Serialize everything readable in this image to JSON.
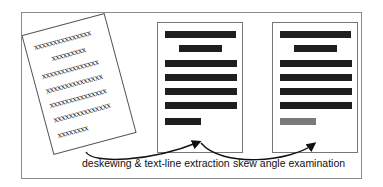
{
  "diagram": {
    "skewed_page": {
      "lines": [
        "xxxxxxxxxxxxxxx",
        "xxxxxxxxx",
        "xxxxxxxxxxxxxxx",
        "xxxxxxxxxxxxxxx",
        "xxxxxxxxxxxxxxx",
        "xxxxxxxxxxxxxxx",
        "xxxxxxxx"
      ],
      "rotation_deg": -15
    },
    "deskewed_page": {
      "bars": [
        {
          "left": 7,
          "top": 8,
          "width": 71
        },
        {
          "left": 21,
          "top": 22,
          "width": 43
        },
        {
          "left": 7,
          "top": 37,
          "width": 72
        },
        {
          "left": 7,
          "top": 51,
          "width": 72
        },
        {
          "left": 7,
          "top": 65,
          "width": 72
        },
        {
          "left": 7,
          "top": 79,
          "width": 72
        },
        {
          "left": 7,
          "top": 95,
          "width": 36
        }
      ]
    },
    "examined_page": {
      "bars": [
        {
          "left": 7,
          "top": 8,
          "width": 71,
          "highlight": false
        },
        {
          "left": 21,
          "top": 22,
          "width": 43,
          "highlight": false
        },
        {
          "left": 7,
          "top": 37,
          "width": 72,
          "highlight": false
        },
        {
          "left": 7,
          "top": 51,
          "width": 72,
          "highlight": false
        },
        {
          "left": 7,
          "top": 65,
          "width": 72,
          "highlight": false
        },
        {
          "left": 7,
          "top": 79,
          "width": 72,
          "highlight": false
        },
        {
          "left": 7,
          "top": 95,
          "width": 36,
          "highlight": true
        }
      ],
      "highlight_color": "#7a7a7a"
    },
    "labels": {
      "step1": "deskewing & text-line extraction",
      "step2": "skew angle examination"
    }
  }
}
